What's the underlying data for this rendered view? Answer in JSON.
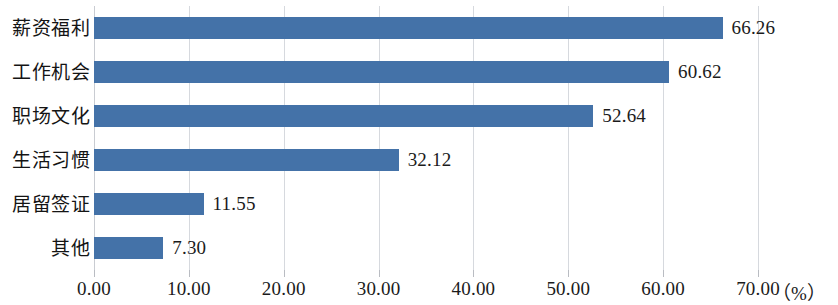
{
  "chart_data": {
    "type": "bar",
    "orientation": "horizontal",
    "title": "",
    "xlabel": "（%）",
    "ylabel": "",
    "categories": [
      "薪资福利",
      "工作机会",
      "职场文化",
      "生活习惯",
      "居留签证",
      "其他"
    ],
    "values": [
      66.26,
      60.62,
      52.64,
      32.12,
      11.55,
      7.3
    ],
    "value_labels": [
      "66.26",
      "60.62",
      "52.64",
      "32.12",
      "11.55",
      "7.30"
    ],
    "xlim": [
      0,
      70
    ],
    "xtick_labels": [
      "0.00",
      "10.00",
      "20.00",
      "30.00",
      "40.00",
      "50.00",
      "60.00",
      "70.00"
    ],
    "xticks": [
      0,
      10,
      20,
      30,
      40,
      50,
      60,
      70
    ],
    "grid": true,
    "legend": false,
    "bar_color": "#4472A8",
    "gridline_color": "#D6D9DE",
    "text_color": "#1B1B1B",
    "background_color": "#FFFFFF"
  },
  "axis": {
    "unit_label": "（%）"
  }
}
